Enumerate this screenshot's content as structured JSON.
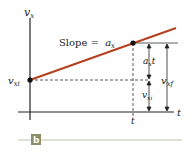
{
  "diagram": {
    "axis_y_label": "v",
    "axis_y_sub": "x",
    "axis_x_label": "t",
    "slope_label": "Slope = ",
    "slope_value": "a",
    "slope_sub": "x",
    "vxi_left": "v",
    "vxi_left_sub": "xi",
    "t_tick": "t",
    "axt_label": "a",
    "axt_sub": "x",
    "axt_t": "t",
    "vxi_right": "v",
    "vxi_right_sub": "xi",
    "vxf_label": "v",
    "vxf_sub": "xf",
    "panel_label": "b",
    "colors": {
      "line": "#b5401f",
      "badge": "#8a8f6a",
      "rule": "#cfd8c4"
    }
  }
}
